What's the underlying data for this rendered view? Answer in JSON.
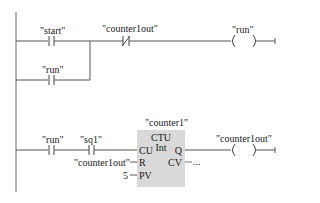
{
  "network": {
    "rung1": {
      "contact_start": "\"start\"",
      "contact_counter1out_nc": "\"counter1out\"",
      "coil_run": "\"run\"",
      "contact_run_parallel": "\"run\""
    },
    "rung2": {
      "instance_name": "\"counter1\"",
      "block_type": "CTU",
      "block_datatype": "Int",
      "contact_run": "\"run\"",
      "contact_sq1": "\"sq1\"",
      "pins": {
        "cu": "CU",
        "r": "R",
        "pv": "PV",
        "q": "Q",
        "cv": "CV"
      },
      "r_input": "\"counter1out\"",
      "pv_input": "5",
      "cv_output": "...",
      "coil_counter1out": "\"counter1out\""
    }
  },
  "colors": {
    "line": "#555555",
    "block_fill": "#d9d9d9"
  }
}
